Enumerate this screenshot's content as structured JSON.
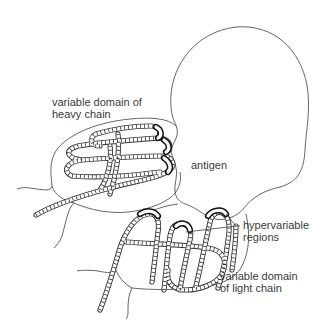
{
  "diagram": {
    "type": "antibody-antigen binding illustration",
    "labels": {
      "heavy_line1": "variable domain of",
      "heavy_line2": "heavy chain",
      "antigen": "antigen",
      "hyper_line1": "hypervariable",
      "hyper_line2": "regions",
      "light_line1": "variable domain",
      "light_line2": "of light chain"
    },
    "colors": {
      "background": "#ffffff",
      "line": "#555555",
      "text": "#3a3a3a"
    }
  }
}
